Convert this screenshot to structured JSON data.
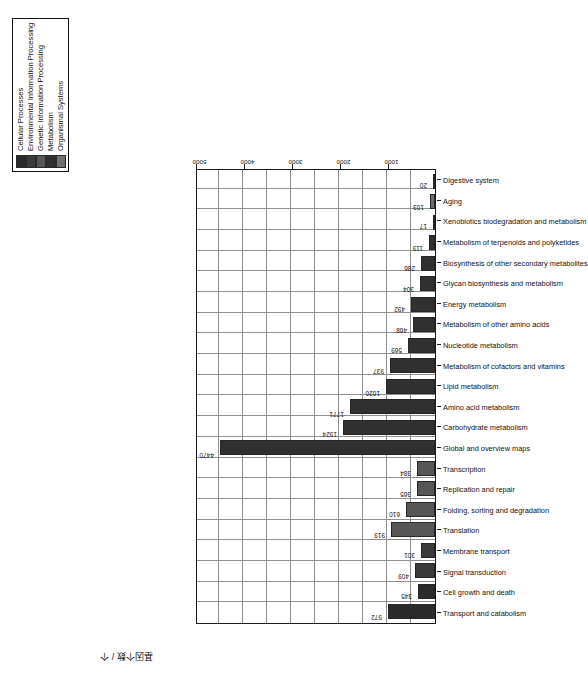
{
  "chart_data": {
    "type": "bar",
    "title": "",
    "xlabel": "",
    "ylabel": "基因个数 / 个",
    "ylim": [
      0,
      5000
    ],
    "grid": true,
    "legend_position": "top-right",
    "tick_labels": [
      "1000",
      "2000",
      "3000",
      "4000",
      "5000"
    ],
    "ticks": [
      1000,
      2000,
      3000,
      4000,
      5000
    ],
    "categories": [
      "Transport and catabolism",
      "Cell growth and death",
      "Signal transduction",
      "Membrane transport",
      "Translation",
      "Folding, sorting and degradation",
      "Replication and repair",
      "Transcription",
      "Global and overview maps",
      "Carbohydrate metabolism",
      "Amino acid metabolism",
      "Lipid metabolism",
      "Metabolism of cofactors and vitamins",
      "Nucleotide metabolism",
      "Metabolism of other amino acids",
      "Energy metabolism",
      "Glycan biosynthesis and metabolism",
      "Biosynthesis of other secondary metabolites",
      "Metabolism of terpenoids and polyketides",
      "Xenobiotics biodegradation and metabolism",
      "Aging",
      "Digestive system"
    ],
    "values": [
      972,
      345,
      409,
      301,
      919,
      610,
      365,
      384,
      4470,
      1924,
      1771,
      1020,
      937,
      569,
      468,
      492,
      304,
      286,
      119,
      17,
      103,
      20
    ],
    "value_labels": [
      "972",
      "345",
      "409",
      "301",
      "919",
      "610",
      "365",
      "384",
      "4470",
      "1924",
      "1771",
      "1020",
      "937",
      "569",
      "468",
      "492",
      "304",
      "286",
      "119",
      "17",
      "103",
      "20"
    ],
    "group_of_bar": [
      0,
      0,
      1,
      1,
      2,
      2,
      2,
      2,
      3,
      3,
      3,
      3,
      3,
      3,
      3,
      3,
      3,
      3,
      3,
      3,
      4,
      4
    ],
    "series": [
      {
        "name": "Cellular Processes",
        "color": "#2b2b2b"
      },
      {
        "name": "Environmental Information Processing",
        "color": "#3a3a3a"
      },
      {
        "name": "Genetic Information Processing",
        "color": "#565656"
      },
      {
        "name": "Metabolism",
        "color": "#303030"
      },
      {
        "name": "Organismal Systems",
        "color": "#6e6e6e"
      }
    ]
  },
  "legend": {
    "items": [
      {
        "label": "Cellular Processes",
        "color": "#2b2b2b"
      },
      {
        "label": "Environmental Information Processing",
        "color": "#3a3a3a"
      },
      {
        "label": "Genetic Information Processing",
        "color": "#565656"
      },
      {
        "label": "Metabolism",
        "color": "#303030"
      },
      {
        "label": "Organismal Systems",
        "color": "#6e6e6e"
      }
    ]
  }
}
